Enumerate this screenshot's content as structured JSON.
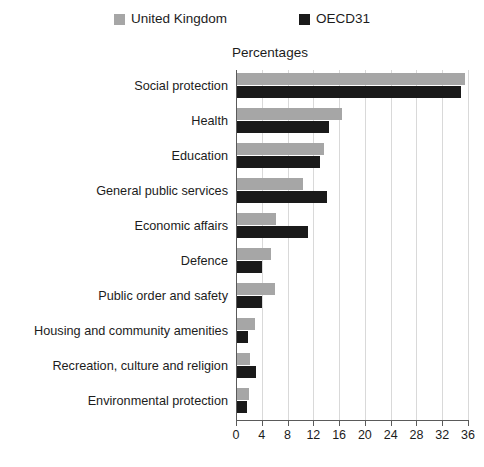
{
  "chart_data": {
    "type": "bar",
    "orientation": "horizontal",
    "title": "",
    "subtitle": "Percentages",
    "xlabel": "",
    "ylabel": "",
    "xlim": [
      0,
      36
    ],
    "xticks": [
      0,
      4,
      8,
      12,
      16,
      20,
      24,
      28,
      32,
      36
    ],
    "grid": true,
    "legend_position": "top",
    "categories": [
      "Social protection",
      "Health",
      "Education",
      "General public services",
      "Economic affairs",
      "Defence",
      "Public order and safety",
      "Housing and community amenities",
      "Recreation, culture and religion",
      "Environmental protection"
    ],
    "series": [
      {
        "name": "United Kingdom",
        "color": "#a6a6a6",
        "values": [
          35.5,
          16.5,
          13.7,
          10.4,
          6.2,
          5.5,
          6.0,
          2.9,
          2.2,
          2.0
        ]
      },
      {
        "name": "OECD31",
        "color": "#1a1a1a",
        "values": [
          34.9,
          14.5,
          13.0,
          14.1,
          11.1,
          4.1,
          4.0,
          1.9,
          3.1,
          1.7
        ]
      }
    ]
  },
  "legend": {
    "items": [
      {
        "label": "United Kingdom",
        "color": "#a6a6a6"
      },
      {
        "label": "OECD31",
        "color": "#1a1a1a"
      }
    ]
  },
  "axis": {
    "tick_labels": [
      "0",
      "4",
      "8",
      "12",
      "16",
      "20",
      "24",
      "28",
      "32",
      "36"
    ]
  }
}
